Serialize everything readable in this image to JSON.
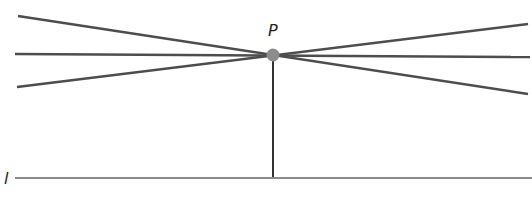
{
  "diagram": {
    "point_label": "P",
    "line_label": "l",
    "colors": {
      "line": "#4d4d4d",
      "baseline": "#8a8a8a",
      "point": "#8c8c8c"
    },
    "point": {
      "x": 273,
      "y": 55,
      "r": 6
    },
    "lines_through_p": [
      {
        "x1": 18,
        "y1": 16,
        "x2": 528,
        "y2": 94
      },
      {
        "x1": 15,
        "y1": 54,
        "x2": 530,
        "y2": 57
      },
      {
        "x1": 17,
        "y1": 87,
        "x2": 528,
        "y2": 24
      }
    ],
    "perpendicular": {
      "x1": 273,
      "y1": 55,
      "x2": 273,
      "y2": 178
    },
    "baseline": {
      "x1": 15,
      "y1": 178,
      "x2": 532,
      "y2": 178
    }
  }
}
